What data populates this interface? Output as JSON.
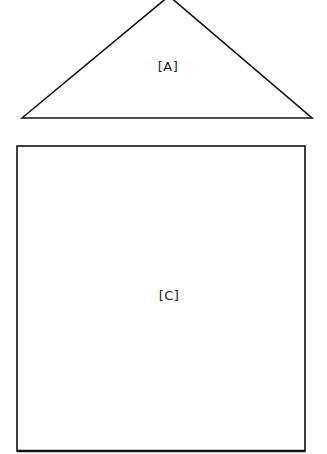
{
  "diagram": {
    "background": "#ffffff",
    "stroke_color": "#111111",
    "shapes": [
      {
        "id": "A",
        "type": "triangle",
        "label": "[A]",
        "points": [
          [
            22,
            118
          ],
          [
            169,
            -4
          ],
          [
            312,
            118
          ]
        ],
        "label_pos": [
          168,
          66
        ]
      },
      {
        "id": "C",
        "type": "rectangle",
        "label": "[C]",
        "rect": {
          "x": 17,
          "y": 146,
          "width": 288,
          "height": 305
        },
        "label_pos": [
          169,
          295
        ]
      }
    ]
  }
}
